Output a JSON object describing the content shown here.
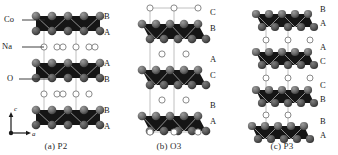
{
  "figure": {
    "background_color": "#ffffff"
  },
  "legend_labels": [
    {
      "name": "Co",
      "text": "Co"
    },
    {
      "name": "Na",
      "text": "Na"
    },
    {
      "name": "O",
      "text": "O"
    }
  ],
  "axes": {
    "vertical_label": "c",
    "horizontal_label": "a"
  },
  "colors": {
    "slab_fill": "#151515",
    "oxygen_sphere": "#6e6e6e",
    "oxygen_sphere_dark": "#4a4a4a",
    "sodium_circle_fill": "#ffffff",
    "sodium_circle_stroke": "#8a8a8a",
    "cell_line": "#a8a8a8",
    "leader_line": "#2b2b2b",
    "text": "#1a1a1a"
  },
  "panels": [
    {
      "id": "a",
      "caption": "(a) P2",
      "polytype": "P2",
      "slab_count": 3,
      "stacking_labels": [
        "B",
        "A",
        "A",
        "B",
        "B",
        "A"
      ],
      "prismatic": true
    },
    {
      "id": "b",
      "caption": "(b) O3",
      "polytype": "O3",
      "slab_count": 3,
      "stacking_labels": [
        "C",
        "B",
        "A",
        "C",
        "B",
        "A"
      ],
      "prismatic": false
    },
    {
      "id": "c",
      "caption": "(c) P3",
      "polytype": "P3",
      "slab_count": 4,
      "stacking_labels": [
        "B",
        "A",
        "A",
        "C",
        "C",
        "B",
        "B",
        "A"
      ],
      "prismatic": true
    }
  ]
}
